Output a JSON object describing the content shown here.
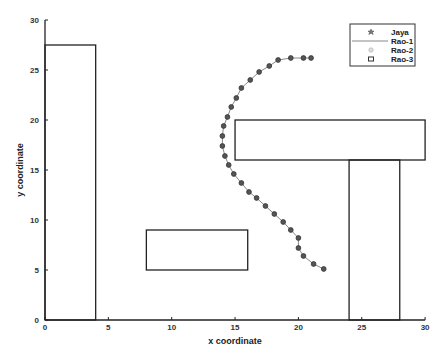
{
  "chart_data": {
    "type": "line",
    "title": "",
    "xlabel": "x coordinate",
    "ylabel": "y coordinate",
    "xlim": [
      0,
      30
    ],
    "ylim": [
      0,
      30
    ],
    "xticks": [
      0,
      5,
      10,
      15,
      20,
      25,
      30
    ],
    "yticks": [
      0,
      5,
      10,
      15,
      20,
      25,
      30
    ],
    "grid": false,
    "legend_position": "upper right",
    "legend": [
      "Jaya",
      "Rao-1",
      "Rao-2",
      "Rao-3"
    ],
    "obstacles": [
      {
        "name": "obstacle-1",
        "x": 0,
        "y": 0,
        "width": 4,
        "height": 27.5
      },
      {
        "name": "obstacle-2",
        "x": 8,
        "y": 5,
        "width": 8,
        "height": 4
      },
      {
        "name": "obstacle-3",
        "x": 15,
        "y": 16,
        "width": 15,
        "height": 4
      },
      {
        "name": "obstacle-4",
        "x": 24,
        "y": 0,
        "width": 4,
        "height": 16
      }
    ],
    "series": [
      {
        "name": "Jaya",
        "marker": "star",
        "points": [
          [
            22.0,
            5.1
          ],
          [
            21.2,
            5.6
          ],
          [
            20.4,
            6.4
          ],
          [
            20.0,
            7.2
          ],
          [
            20.0,
            8.2
          ],
          [
            19.4,
            9.0
          ],
          [
            18.8,
            9.8
          ],
          [
            18.1,
            10.6
          ],
          [
            17.4,
            11.4
          ],
          [
            16.7,
            12.2
          ],
          [
            16.1,
            12.8
          ],
          [
            15.5,
            13.7
          ],
          [
            14.9,
            14.6
          ],
          [
            14.5,
            15.5
          ],
          [
            14.2,
            16.4
          ],
          [
            14.0,
            17.4
          ],
          [
            14.0,
            18.4
          ],
          [
            14.1,
            19.4
          ],
          [
            14.4,
            20.3
          ],
          [
            14.7,
            21.3
          ],
          [
            15.1,
            22.2
          ],
          [
            15.5,
            23.2
          ],
          [
            16.2,
            24.0
          ],
          [
            16.9,
            24.8
          ],
          [
            17.7,
            25.4
          ],
          [
            18.4,
            26.0
          ],
          [
            19.4,
            26.2
          ],
          [
            20.4,
            26.2
          ],
          [
            21.0,
            26.2
          ]
        ]
      },
      {
        "name": "Rao-1",
        "marker": "line",
        "points": "same path as Jaya"
      },
      {
        "name": "Rao-2",
        "marker": "circle",
        "points": "same path as Jaya"
      },
      {
        "name": "Rao-3",
        "marker": "square",
        "points": "same path as Jaya"
      }
    ]
  },
  "colors": {
    "axis": "#222222",
    "obstacle": "#222222",
    "path_line": "#888888",
    "marker_fill": "#555555",
    "marker_stroke": "#333333"
  }
}
